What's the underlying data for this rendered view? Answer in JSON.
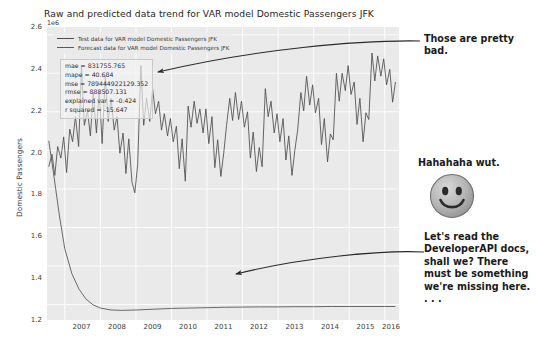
{
  "figure": {
    "title": "Raw and predicted data trend for VAR model Domestic Passengers JFK",
    "offset_text": "1e6",
    "ylabel": "Domestic Passengers",
    "xlabel": "",
    "legend": [
      {
        "label": "Test data for VAR model Domestic Passengers JFK",
        "color": "#4d4d4d"
      },
      {
        "label": "Forecast data for VAR model Domestic Passengers JFK",
        "color": "#5a5a5a"
      }
    ],
    "metrics": [
      "mae = 831755.765",
      "mape = 40.684",
      "mse = 789444922129.352",
      "rmse = 888507.131",
      "explained var = -0.424",
      "r squared = -15.647"
    ]
  },
  "annotations": {
    "top": "Those are pretty bad.",
    "middle": "Hahahaha wut.",
    "bottom": "Let's read the DeveloperAPI docs, shall we? There must be something we're missing here. . . .",
    "smiley_name": "smiley-face-icon"
  },
  "chart_data": {
    "type": "line",
    "title": "Raw and predicted data trend for VAR model Domestic Passengers JFK",
    "xlabel": "",
    "ylabel": "Domestic Passengers",
    "y_offset_multiplier": "1e6",
    "xlim": [
      2006.5,
      2016.4
    ],
    "ylim": [
      1120000,
      2640000
    ],
    "xticks": [
      2007,
      2008,
      2009,
      2010,
      2011,
      2012,
      2013,
      2014,
      2015,
      2016
    ],
    "yticks": [
      1200000,
      1400000,
      1600000,
      1800000,
      2000000,
      2200000,
      2400000,
      2600000
    ],
    "grid": true,
    "legend_position": "upper left",
    "series": [
      {
        "name": "Test data for VAR model Domestic Passengers JFK",
        "color": "#4d4d4d",
        "x": [
          2006.55,
          2006.64,
          2006.72,
          2006.8,
          2006.89,
          2006.97,
          2007.05,
          2007.14,
          2007.22,
          2007.3,
          2007.39,
          2007.47,
          2007.55,
          2007.64,
          2007.72,
          2007.8,
          2007.89,
          2007.97,
          2008.05,
          2008.14,
          2008.22,
          2008.3,
          2008.39,
          2008.47,
          2008.55,
          2008.64,
          2008.72,
          2008.8,
          2008.89,
          2008.97,
          2009.05,
          2009.14,
          2009.22,
          2009.3,
          2009.39,
          2009.47,
          2009.55,
          2009.64,
          2009.72,
          2009.8,
          2009.89,
          2009.97,
          2010.05,
          2010.14,
          2010.22,
          2010.3,
          2010.39,
          2010.47,
          2010.55,
          2010.64,
          2010.72,
          2010.8,
          2010.89,
          2010.97,
          2011.05,
          2011.14,
          2011.22,
          2011.3,
          2011.39,
          2011.47,
          2011.55,
          2011.64,
          2011.72,
          2011.8,
          2011.89,
          2011.97,
          2012.05,
          2012.14,
          2012.22,
          2012.3,
          2012.39,
          2012.47,
          2012.55,
          2012.64,
          2012.72,
          2012.8,
          2012.89,
          2012.97,
          2013.05,
          2013.14,
          2013.22,
          2013.3,
          2013.39,
          2013.47,
          2013.55,
          2013.64,
          2013.72,
          2013.8,
          2013.89,
          2013.97,
          2014.05,
          2014.14,
          2014.22,
          2014.3,
          2014.39,
          2014.47,
          2014.55,
          2014.64,
          2014.72,
          2014.8,
          2014.89,
          2014.97,
          2015.05,
          2015.14,
          2015.22,
          2015.3,
          2015.39,
          2015.47,
          2015.55,
          2015.64,
          2015.72,
          2015.8,
          2015.89,
          2015.97,
          2016.05,
          2016.14,
          2016.22,
          2016.3
        ],
        "values": [
          1915000,
          1980000,
          1870000,
          2020000,
          1960000,
          2070000,
          1885000,
          2110000,
          2045000,
          2175000,
          2020000,
          2440000,
          2130000,
          2205000,
          2075000,
          2300000,
          2090000,
          2310000,
          2035000,
          2385000,
          2150000,
          2270000,
          2105000,
          2175000,
          1985000,
          2090000,
          1880000,
          2060000,
          1835000,
          1780000,
          1925000,
          2440000,
          2130000,
          2270000,
          2150000,
          2320000,
          2190000,
          2255000,
          2105000,
          2190000,
          2075000,
          2165000,
          2045000,
          2125000,
          1905000,
          2060000,
          1840000,
          2230000,
          2120000,
          2255000,
          2140000,
          2215000,
          2090000,
          2215000,
          2035000,
          2175000,
          1910000,
          2055000,
          1865000,
          1985000,
          2130000,
          2270000,
          2155000,
          2300000,
          2160000,
          2255000,
          2120000,
          2200000,
          1960000,
          2095000,
          1890000,
          2015000,
          1915000,
          2320000,
          2175000,
          2255000,
          2090000,
          2190000,
          2045000,
          2165000,
          1950000,
          2075000,
          1870000,
          2000000,
          2105000,
          2300000,
          2205000,
          2385000,
          2235000,
          2340000,
          2195000,
          2270000,
          2030000,
          2165000,
          1940000,
          2085000,
          2055000,
          2400000,
          2255000,
          2400000,
          2310000,
          2440000,
          2290000,
          2355000,
          2135000,
          2270000,
          2045000,
          2195000,
          2160000,
          2505000,
          2360000,
          2490000,
          2385000,
          2475000,
          2340000,
          2420000,
          2250000,
          2355000
        ]
      },
      {
        "name": "Forecast data for VAR model Domestic Passengers JFK",
        "color": "#5a5a5a",
        "x": [
          2006.55,
          2006.7,
          2006.85,
          2007.0,
          2007.2,
          2007.4,
          2007.6,
          2007.8,
          2008.0,
          2008.3,
          2008.6,
          2009.0,
          2009.5,
          2010.0,
          2010.5,
          2011.0,
          2011.5,
          2012.0,
          2012.5,
          2013.0,
          2013.5,
          2014.0,
          2014.5,
          2015.0,
          2015.5,
          2016.0,
          2016.3
        ],
        "values": [
          2050000,
          1860000,
          1660000,
          1490000,
          1360000,
          1280000,
          1228000,
          1198000,
          1182000,
          1172000,
          1170000,
          1172000,
          1176000,
          1180000,
          1182000,
          1184000,
          1186000,
          1187000,
          1188000,
          1188000,
          1189000,
          1189000,
          1190000,
          1190000,
          1190000,
          1190000,
          1190000
        ],
        "note": "flat degenerate forecast near 1.19e6"
      }
    ]
  }
}
